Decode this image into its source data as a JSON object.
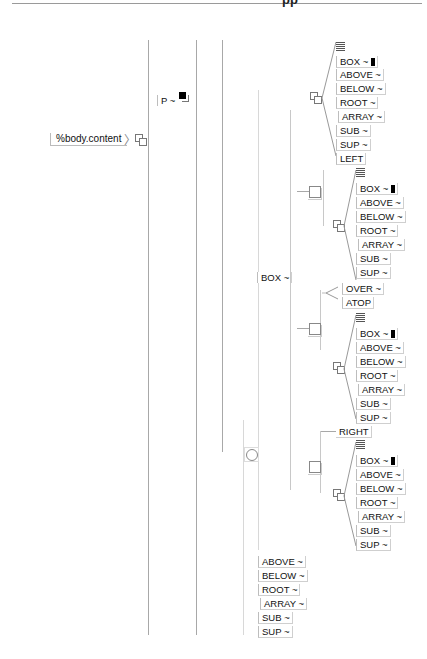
{
  "header": {
    "fragment": "pp"
  },
  "root": {
    "label": "%body.content",
    "icon": "stacked-squares-icon"
  },
  "p_node": {
    "label": "P ~",
    "icon": "filled-square-stacked-icon"
  },
  "box_node": {
    "label": "BOX ~"
  },
  "groups": [
    {
      "name": "group-1",
      "items": [
        "BOX ~",
        "ABOVE ~",
        "BELOW ~",
        "ROOT ~",
        "ARRAY ~",
        "SUB ~",
        "SUP ~"
      ],
      "trailer": "LEFT"
    },
    {
      "name": "group-2",
      "items": [
        "BOX ~",
        "ABOVE ~",
        "BELOW ~",
        "ROOT ~",
        "ARRAY ~",
        "SUB ~",
        "SUP ~"
      ]
    },
    {
      "name": "group-3",
      "head": [
        "OVER ~",
        "ATOP"
      ],
      "items": [
        "BOX ~",
        "ABOVE ~",
        "BELOW ~",
        "ROOT ~",
        "ARRAY ~",
        "SUB ~",
        "SUP ~"
      ]
    },
    {
      "name": "group-4",
      "head": [
        "RIGHT"
      ],
      "items": [
        "BOX ~",
        "ABOVE ~",
        "BELOW ~",
        "ROOT ~",
        "ARRAY ~",
        "SUB ~",
        "SUP ~"
      ]
    }
  ],
  "bottom_list": [
    "ABOVE ~",
    "BELOW ~",
    "ROOT ~",
    "ARRAY ~",
    "SUB ~",
    "SUP ~"
  ]
}
